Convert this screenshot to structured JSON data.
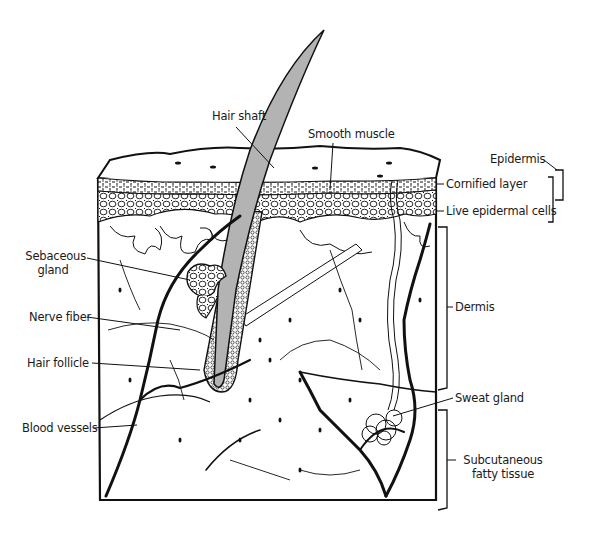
{
  "diagram": {
    "colors": {
      "ink": "#111111",
      "hair": "#b3b3b3",
      "background": "#ffffff"
    },
    "labels": {
      "hair_shaft": "Hair shaft",
      "smooth_muscle": "Smooth muscle",
      "epidermis": "Epidermis",
      "cornified_layer": "Cornified layer",
      "live_epidermal_cells": "Live epidermal cells",
      "sebaceous_gland_line1": "Sebaceous",
      "sebaceous_gland_line2": "gland",
      "nerve_fiber": "Nerve fiber",
      "hair_follicle": "Hair follicle",
      "blood_vessels": "Blood vessels",
      "dermis": "Dermis",
      "sweat_gland": "Sweat gland",
      "subcutaneous_line1": "Subcutaneous",
      "subcutaneous_line2": "fatty tissue"
    }
  }
}
